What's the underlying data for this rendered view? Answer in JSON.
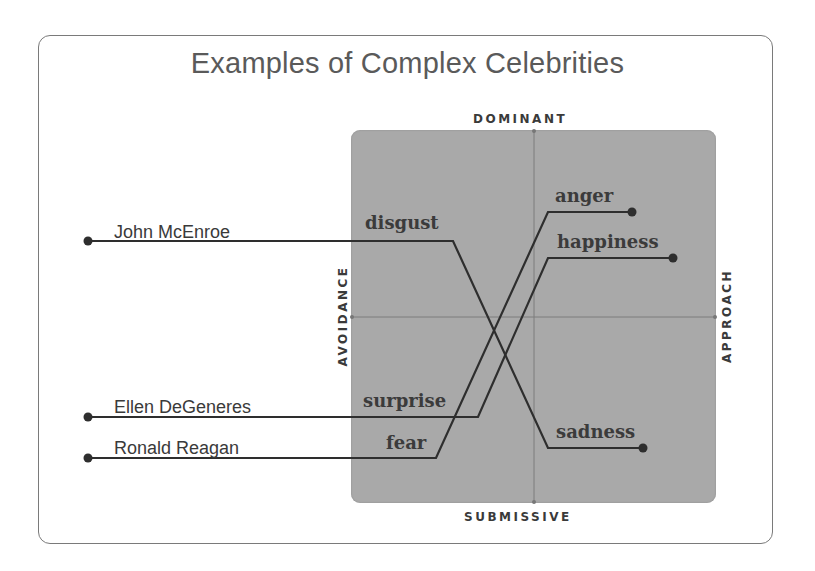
{
  "title": "Examples of Complex Celebrities",
  "axes": {
    "top": "DOMINANT",
    "bottom": "SUBMISSIVE",
    "left": "AVOIDANCE",
    "right": "APPROACH"
  },
  "colors": {
    "quadrant_fill": "#a9a9a9",
    "line": "#2e2e2e",
    "frame": "#7a7a7a",
    "title": "#5a5a5a"
  },
  "celebrities": [
    {
      "name": "John McEnroe",
      "from_emotion": "disgust",
      "to_emotion": "sadness"
    },
    {
      "name": "Ellen DeGeneres",
      "from_emotion": "surprise",
      "to_emotion": "happiness"
    },
    {
      "name": "Ronald Reagan",
      "from_emotion": "fear",
      "to_emotion": "anger"
    }
  ],
  "emotions": {
    "disgust": "disgust",
    "anger": "anger",
    "happiness": "happiness",
    "surprise": "surprise",
    "fear": "fear",
    "sadness": "sadness"
  }
}
